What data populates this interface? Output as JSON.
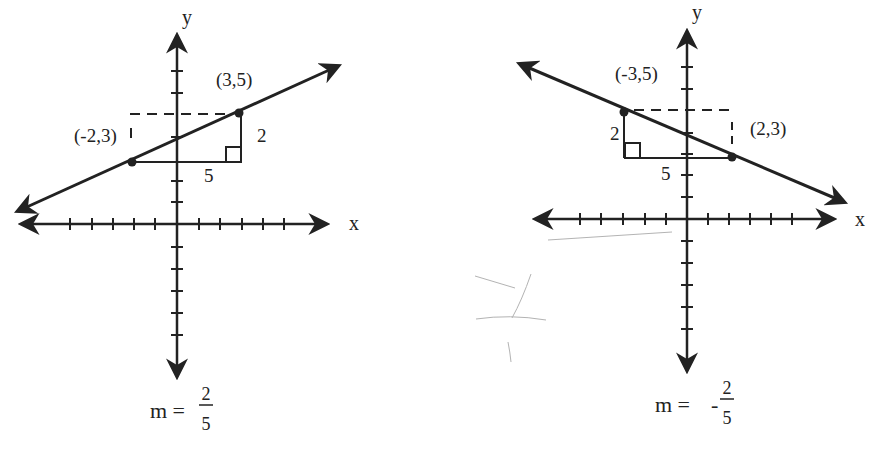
{
  "graphs": [
    {
      "id": "positive-slope",
      "axis_labels": {
        "x": "x",
        "y": "y"
      },
      "points": [
        {
          "label": "(-2,3)",
          "x": -2,
          "y": 3
        },
        {
          "label": "(3,5)",
          "x": 3,
          "y": 5
        }
      ],
      "rise_label": "2",
      "run_label": "5",
      "slope": {
        "prefix": "m =",
        "sign": "",
        "numerator": "2",
        "denominator": "5"
      }
    },
    {
      "id": "negative-slope",
      "axis_labels": {
        "x": "x",
        "y": "y"
      },
      "points": [
        {
          "label": "(-3,5)",
          "x": -3,
          "y": 5
        },
        {
          "label": "(2,3)",
          "x": 2,
          "y": 3
        }
      ],
      "rise_label": "2",
      "run_label": "5",
      "slope": {
        "prefix": "m =",
        "sign": "-",
        "numerator": "2",
        "denominator": "5"
      }
    }
  ],
  "colors": {
    "ink": "#222222",
    "pencil": "#9a9a9a",
    "background": "#ffffff"
  }
}
